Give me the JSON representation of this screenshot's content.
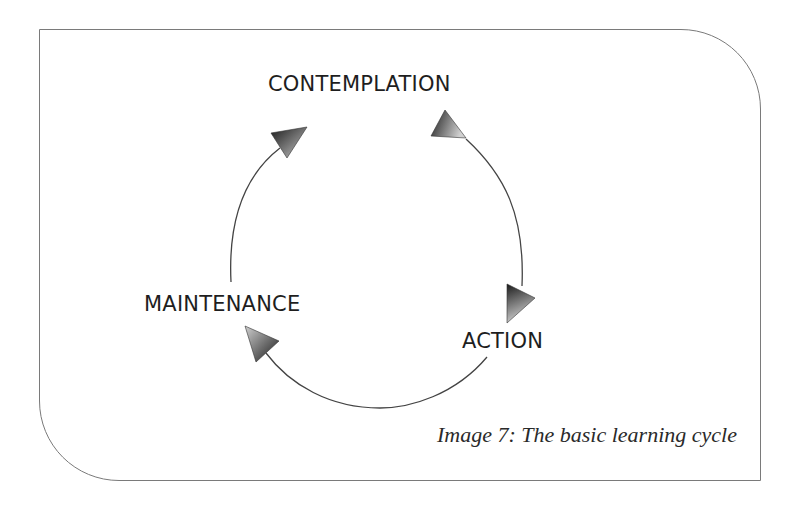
{
  "diagram": {
    "type": "cycle",
    "stages": [
      {
        "id": "contemplation",
        "label": "CONTEMPLATION"
      },
      {
        "id": "action",
        "label": "ACTION"
      },
      {
        "id": "maintenance",
        "label": "MAINTENANCE"
      }
    ],
    "flow": [
      {
        "from": "maintenance",
        "to": "contemplation"
      },
      {
        "from": "contemplation",
        "to": "action"
      },
      {
        "from": "action",
        "to": "maintenance"
      }
    ],
    "direction": "clockwise",
    "caption": "Image 7: The basic learning cycle"
  },
  "colors": {
    "frame": "#7a7a7a",
    "line": "#444444",
    "text": "#1e1e1e",
    "arrow_dark": "#1a1a1a",
    "arrow_light": "#c8c8c8"
  }
}
